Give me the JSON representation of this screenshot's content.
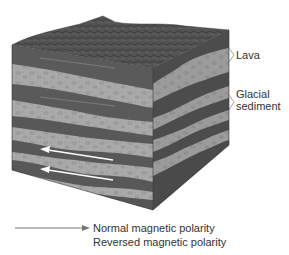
{
  "diagram": {
    "type": "block-diagram",
    "labels": [
      {
        "id": "lava",
        "text": "Lava"
      },
      {
        "id": "glacial",
        "text": "Glacial\nsediment",
        "line1": "Glacial",
        "line2": "sediment"
      }
    ],
    "legend": {
      "normal": "Normal magnetic polarity",
      "reversed": "Reversed magnetic polarity"
    },
    "colors": {
      "lava": "#5a5a5a",
      "lava_side": "#4a4a4a",
      "sediment": "#a8a8a8",
      "sediment_side": "#9a9a9a",
      "top_surface": "#555555",
      "arrow_normal": "#8a8a8a",
      "arrow_reversed": "#ffffff",
      "text": "#333333"
    }
  }
}
